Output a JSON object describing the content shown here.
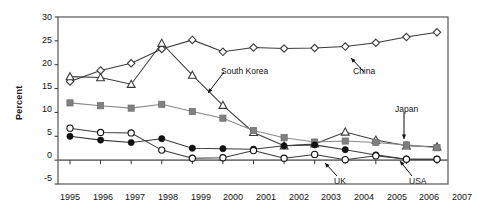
{
  "chart_data": {
    "type": "line",
    "title": "",
    "xlabel": "",
    "ylabel": "Percent",
    "categories": [
      "1995",
      "1996",
      "1997",
      "1998",
      "1999",
      "2000",
      "2001",
      "2002",
      "2003",
      "2004",
      "2005",
      "2006",
      "2007"
    ],
    "x": [
      1995,
      1996,
      1997,
      1998,
      1999,
      2000,
      2001,
      2002,
      2003,
      2004,
      2005,
      2006,
      2007
    ],
    "ylim": [
      -5,
      30
    ],
    "yticks": [
      -5,
      0,
      5,
      10,
      15,
      20,
      25,
      30
    ],
    "grid": false,
    "legend_position": "none-inline-annotations",
    "series": [
      {
        "name": "China",
        "marker": "open-diamond",
        "color": "#3a3a3a",
        "values": [
          16.5,
          18.8,
          20.3,
          23.3,
          25.2,
          22.7,
          23.6,
          23.4,
          23.5,
          23.8,
          24.6,
          25.8,
          26.8
        ]
      },
      {
        "name": "South Korea",
        "marker": "open-triangle",
        "color": "#3a3a3a",
        "values": [
          17.5,
          17.3,
          15.9,
          24.5,
          17.8,
          11.5,
          5.8,
          3.0,
          3.4,
          5.9,
          4.2,
          3.0,
          2.8
        ]
      },
      {
        "name": "Japan",
        "marker": "filled-square",
        "color": "#808080",
        "values": [
          12.0,
          11.4,
          10.9,
          11.7,
          10.2,
          8.8,
          6.2,
          4.7,
          3.8,
          4.0,
          3.7,
          3.2,
          2.6
        ]
      },
      {
        "name": "USA",
        "marker": "filled-circle",
        "color": "#111111",
        "values": [
          5.0,
          4.2,
          3.7,
          4.5,
          2.5,
          2.4,
          2.3,
          3.0,
          3.2,
          2.2,
          1.1,
          0.2,
          0.2
        ]
      },
      {
        "name": "UK",
        "marker": "open-circle",
        "color": "#111111",
        "values": [
          6.7,
          5.8,
          5.7,
          2.1,
          0.4,
          0.5,
          2.0,
          0.4,
          1.2,
          0.1,
          0.9,
          0.2,
          0.2
        ]
      }
    ],
    "annotations": [
      {
        "label": "South Korea",
        "points_to_series": "South Korea",
        "points_to_year": 2000
      },
      {
        "label": "China",
        "points_to_series": "China",
        "points_to_year": 2003
      },
      {
        "label": "Japan",
        "points_to_series": "Japan",
        "points_to_year": 2006
      },
      {
        "label": "UK",
        "points_to_series": "UK",
        "points_to_year": 2003
      },
      {
        "label": "USA",
        "points_to_series": "USA",
        "points_to_year": 2006
      }
    ]
  },
  "axis": {
    "y_label": "Percent",
    "y_ticks": [
      "30",
      "25",
      "20",
      "15",
      "10",
      "5",
      "0",
      "-5"
    ],
    "x_ticks": [
      "1995",
      "1996",
      "1997",
      "1998",
      "1999",
      "2000",
      "2001",
      "2002",
      "2003",
      "2004",
      "2005",
      "2006",
      "2007"
    ]
  },
  "annotations": {
    "south_korea": "South Korea",
    "china": "China",
    "japan": "Japan",
    "uk": "UK",
    "usa": "USA"
  },
  "colors": {
    "frame": "#555555",
    "zero_line": "#777777",
    "japan_series": "#808080",
    "text": "#111111"
  }
}
